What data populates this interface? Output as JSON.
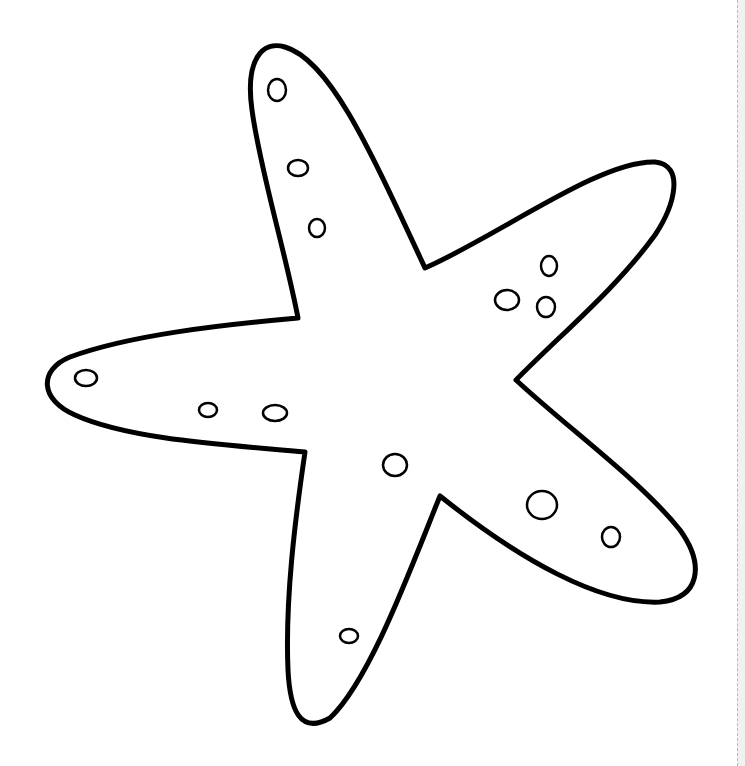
{
  "page": {
    "background": "#ffffff",
    "stroke_color": "#000000",
    "outline_stroke_width": 5,
    "spot_stroke_width": 2.5
  },
  "starfish": {
    "arms": [
      "top",
      "right",
      "lower-right",
      "bottom",
      "left"
    ],
    "spots": [
      {
        "cx": 277,
        "cy": 90,
        "rx": 9,
        "ry": 11
      },
      {
        "cx": 298,
        "cy": 168,
        "rx": 10,
        "ry": 8
      },
      {
        "cx": 317,
        "cy": 228,
        "rx": 8,
        "ry": 9
      },
      {
        "cx": 549,
        "cy": 266,
        "rx": 8,
        "ry": 10
      },
      {
        "cx": 507,
        "cy": 300,
        "rx": 12,
        "ry": 10
      },
      {
        "cx": 546,
        "cy": 307,
        "rx": 9,
        "ry": 10
      },
      {
        "cx": 86,
        "cy": 378,
        "rx": 11,
        "ry": 8
      },
      {
        "cx": 208,
        "cy": 410,
        "rx": 9,
        "ry": 7
      },
      {
        "cx": 275,
        "cy": 413,
        "rx": 12,
        "ry": 8
      },
      {
        "cx": 395,
        "cy": 465,
        "rx": 12,
        "ry": 11
      },
      {
        "cx": 542,
        "cy": 505,
        "rx": 15,
        "ry": 14
      },
      {
        "cx": 611,
        "cy": 537,
        "rx": 9,
        "ry": 10
      },
      {
        "cx": 349,
        "cy": 636,
        "rx": 9,
        "ry": 7
      }
    ]
  }
}
